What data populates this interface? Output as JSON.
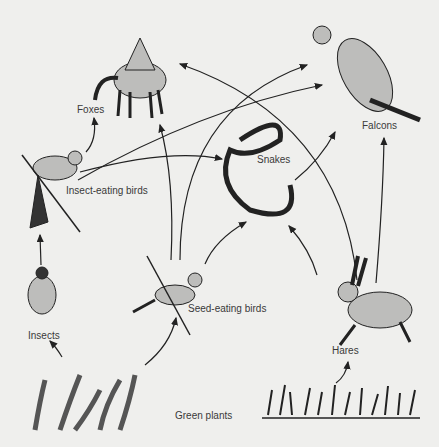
{
  "diagram": {
    "nodes": [
      {
        "id": "foxes",
        "label": "Foxes"
      },
      {
        "id": "falcons",
        "label": "Falcons"
      },
      {
        "id": "snakes",
        "label": "Snakes"
      },
      {
        "id": "insect_eating_birds",
        "label": "Insect-eating birds"
      },
      {
        "id": "seed_eating_birds",
        "label": "Seed-eating birds"
      },
      {
        "id": "insects",
        "label": "Insects"
      },
      {
        "id": "hares",
        "label": "Hares"
      },
      {
        "id": "green_plants",
        "label": "Green plants"
      }
    ],
    "edges": [
      {
        "from": "green_plants",
        "to": "insects"
      },
      {
        "from": "green_plants",
        "to": "seed_eating_birds"
      },
      {
        "from": "green_plants",
        "to": "hares"
      },
      {
        "from": "insects",
        "to": "insect_eating_birds"
      },
      {
        "from": "insect_eating_birds",
        "to": "foxes"
      },
      {
        "from": "insect_eating_birds",
        "to": "falcons"
      },
      {
        "from": "insect_eating_birds",
        "to": "snakes"
      },
      {
        "from": "seed_eating_birds",
        "to": "foxes"
      },
      {
        "from": "seed_eating_birds",
        "to": "falcons"
      },
      {
        "from": "seed_eating_birds",
        "to": "snakes"
      },
      {
        "from": "snakes",
        "to": "falcons"
      },
      {
        "from": "hares",
        "to": "snakes"
      },
      {
        "from": "hares",
        "to": "foxes"
      },
      {
        "from": "hares",
        "to": "falcons"
      }
    ]
  }
}
